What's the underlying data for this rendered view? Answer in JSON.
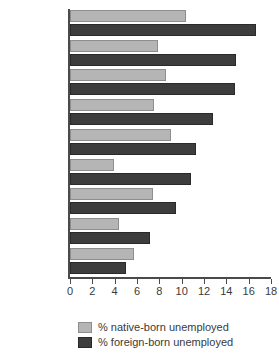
{
  "chart_data": {
    "type": "bar",
    "orientation": "horizontal",
    "title": "",
    "xlabel": "",
    "ylabel": "",
    "xlim": [
      0,
      18
    ],
    "xticks": [
      0,
      2,
      4,
      6,
      8,
      10,
      12,
      14,
      16,
      18
    ],
    "grid": false,
    "legend_position": "bottom",
    "categories": [
      "Germany",
      "Sweden",
      "France",
      "Czech Rep.",
      "Spain",
      "Netherlands",
      "Italy",
      "UK",
      "US"
    ],
    "series": [
      {
        "name": "% native-born unemployed",
        "color": "#b5b5b5",
        "values": [
          10.4,
          7.9,
          8.6,
          7.5,
          9.0,
          3.9,
          7.4,
          4.4,
          5.7
        ]
      },
      {
        "name": "% foreign-born unemployed",
        "color": "#3d3d3d",
        "values": [
          16.7,
          14.9,
          14.8,
          12.8,
          11.3,
          10.8,
          9.5,
          7.2,
          5.0
        ]
      }
    ]
  },
  "legend": {
    "items": [
      {
        "label": "% native-born unemployed",
        "color": "#b5b5b5"
      },
      {
        "label": "% foreign-born unemployed",
        "color": "#3d3d3d"
      }
    ]
  },
  "axis": {
    "tick_labels": [
      "0",
      "2",
      "4",
      "6",
      "8",
      "10",
      "12",
      "14",
      "16",
      "18"
    ]
  }
}
